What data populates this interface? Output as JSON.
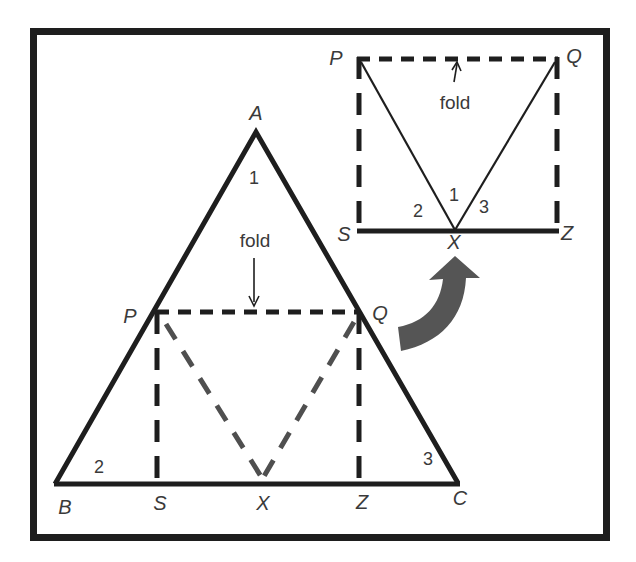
{
  "figure": {
    "colors": {
      "ink": "#1e1e1e",
      "grey_dash": "#4f4f4f",
      "arrow": "#555555",
      "label": "#3a3a3a",
      "background": "#ffffff"
    }
  },
  "main_triangle": {
    "vertices": {
      "A": {
        "label": "A"
      },
      "B": {
        "label": "B"
      },
      "C": {
        "label": "C"
      }
    },
    "points": {
      "P": {
        "label": "P"
      },
      "Q": {
        "label": "Q"
      },
      "S": {
        "label": "S"
      },
      "X": {
        "label": "X"
      },
      "Z": {
        "label": "Z"
      }
    },
    "angles": {
      "at_A": "1",
      "at_B": "2",
      "at_C": "3"
    },
    "fold_label": "fold"
  },
  "inset": {
    "points": {
      "P": {
        "label": "P"
      },
      "Q": {
        "label": "Q"
      },
      "S": {
        "label": "S"
      },
      "X": {
        "label": "X"
      },
      "Z": {
        "label": "Z"
      }
    },
    "angles": {
      "middle": "1",
      "left": "2",
      "right": "3"
    },
    "fold_label": "fold"
  }
}
